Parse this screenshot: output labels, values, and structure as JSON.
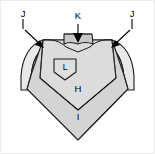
{
  "figure": {
    "kind": "patent-line-drawing",
    "background_color": "#ffffff",
    "border_color": "#eceaea",
    "outline_color": "#1a1a1a",
    "width": 155,
    "height": 154
  },
  "parts": [
    {
      "id": "body",
      "name": "lower-body-panel",
      "label": "I",
      "fill": "#d4d4d4"
    },
    {
      "id": "yoke",
      "name": "chest-yoke-panel",
      "label": "H",
      "fill": "#dcdcdc"
    },
    {
      "id": "collar",
      "name": "collar-band",
      "label": "K",
      "fill": "#c9c9c9"
    },
    {
      "id": "sleeve-left",
      "name": "left-sleeve",
      "label": "J",
      "fill": "#e8e8e8"
    },
    {
      "id": "sleeve-right",
      "name": "right-sleeve",
      "label": "J",
      "fill": "#e8e8e8"
    },
    {
      "id": "pocket",
      "name": "chest-pocket-emblem",
      "label": "L",
      "fill": "#dedede"
    }
  ],
  "callouts": [
    {
      "id": "callout-j-left",
      "label": "J",
      "label_x": 23,
      "label_y": 23,
      "points_to": "left-sleeve"
    },
    {
      "id": "callout-k",
      "label": "K",
      "label_x": 78,
      "label_y": 16,
      "points_to": "collar-band"
    },
    {
      "id": "callout-j-right",
      "label": "J",
      "label_x": 132,
      "label_y": 23,
      "points_to": "right-sleeve"
    },
    {
      "id": "inline-h",
      "label": "H",
      "label_x": 78,
      "label_y": 89,
      "points_to": "chest-yoke-panel"
    },
    {
      "id": "inline-i",
      "label": "I",
      "label_x": 78,
      "label_y": 117,
      "points_to": "lower-body-panel"
    },
    {
      "id": "inline-l",
      "label": "L",
      "label_x": 65,
      "label_y": 69,
      "points_to": "chest-pocket-emblem"
    }
  ]
}
